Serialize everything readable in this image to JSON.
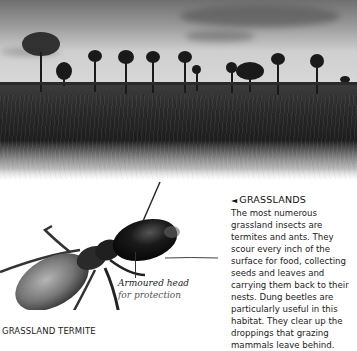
{
  "photo": {
    "subject": "grassland landscape with palm trees at dusk",
    "style": "black-and-white"
  },
  "termite_figure": {
    "annotation": {
      "line1": "Armoured head",
      "line2": "for protection"
    },
    "caption": "GRASSLAND TERMITE"
  },
  "sidebar": {
    "arrow_icon": "◄",
    "heading": "GRASSLANDS",
    "body": "The most numerous grassland insects are termites and ants. They scour every inch of the surface for food, collecting seeds and leaves and carrying them back to their nests. Dung beetles are particularly useful in this habitat. They clear up the droppings that grazing mammals leave behind."
  }
}
